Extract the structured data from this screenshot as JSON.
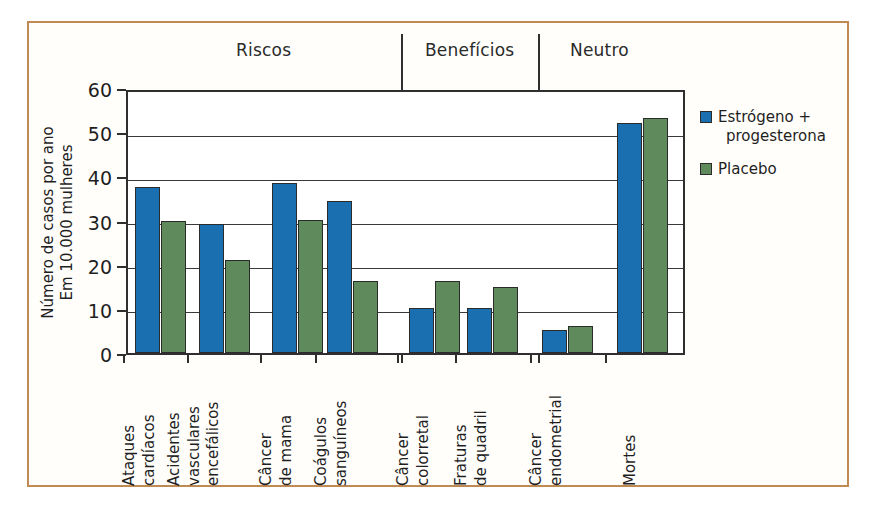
{
  "figure": {
    "frame_color": "#c08a55",
    "background": "#ffffff"
  },
  "sections": [
    {
      "label": "Riscos"
    },
    {
      "label": "Benefícios"
    },
    {
      "label": "Neutro"
    }
  ],
  "legend": {
    "items": [
      {
        "label": "Estrógeno + progesterona",
        "line1": "Estrógeno +",
        "line2": "progesterona",
        "color": "#1a6fb0"
      },
      {
        "label": "Placebo",
        "line1": "Placebo",
        "line2": "",
        "color": "#5f8a5b"
      }
    ]
  },
  "yaxis": {
    "title_line1": "Número de casos por ano",
    "title_line2": "Em 10.000 mulheres",
    "ticks": [
      "0",
      "10",
      "20",
      "30",
      "40",
      "50",
      "60"
    ]
  },
  "chart_data": {
    "type": "bar",
    "title": "",
    "subtitle": "",
    "xlabel": "",
    "ylabel": "Número de casos por ano Em 10.000 mulheres",
    "ylim": [
      0,
      60
    ],
    "ytick_values": [
      0,
      10,
      20,
      30,
      40,
      50,
      60
    ],
    "grid": true,
    "legend_position": "right",
    "group_labels": [
      "Riscos",
      "Benefícios",
      "Neutro"
    ],
    "groups": [
      {
        "name": "Riscos",
        "categories": [
          "Ataques cardíacos",
          "Acidentes vasculares encefálicos",
          "Câncer de mama",
          "Coágulos sanguíneos"
        ]
      },
      {
        "name": "Benefícios",
        "categories": [
          "Câncer colorretal",
          "Fraturas de quadril"
        ]
      },
      {
        "name": "Neutro",
        "categories": [
          "Câncer endometrial",
          "Mortes"
        ]
      }
    ],
    "categories": [
      "Ataques cardíacos",
      "Acidentes vasculares encefálicos",
      "Câncer de mama",
      "Coágulos sanguíneos",
      "Câncer colorretal",
      "Fraturas de quadril",
      "Câncer endometrial",
      "Mortes"
    ],
    "category_lines": [
      [
        "Ataques",
        "cardíacos"
      ],
      [
        "Acidentes",
        "vasculares",
        "encefálicos"
      ],
      [
        "Câncer",
        "de mama"
      ],
      [
        "Coágulos",
        "sanguíneos"
      ],
      [
        "Câncer",
        "colorretal"
      ],
      [
        "Fraturas",
        "de quadril"
      ],
      [
        "Câncer",
        "endometrial"
      ],
      [
        "Mortes"
      ]
    ],
    "series": [
      {
        "name": "Estrógeno + progesterona",
        "color": "#1a6fb0",
        "values": [
          37.5,
          29.2,
          38.4,
          34.4,
          10.2,
          10.3,
          5.2,
          52.0
        ]
      },
      {
        "name": "Placebo",
        "color": "#5f8a5b",
        "values": [
          30.0,
          21.1,
          30.1,
          16.3,
          16.4,
          15.0,
          6.1,
          53.3
        ]
      }
    ]
  }
}
